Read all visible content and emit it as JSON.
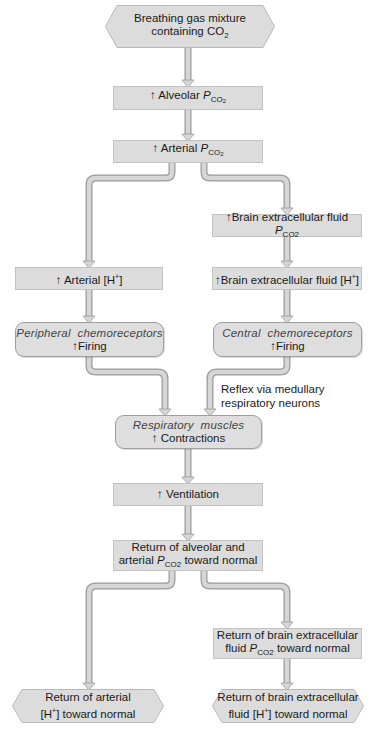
{
  "diagram": {
    "colors": {
      "box_fill": "#dcdcdc",
      "box_border": "#c2c2c2",
      "arrow_fill": "#d6d6d6",
      "arrow_stroke": "#9a9a9a"
    },
    "nodes": {
      "start": {
        "line1": "Breathing gas mixture",
        "line2_prefix": "containing CO",
        "line2_sub": "2"
      },
      "alveolar": {
        "arrow": "↑",
        "label": "Alveolar",
        "p": "P",
        "sub": "CO",
        "sub2": "2"
      },
      "arterial_pco2": {
        "arrow": "↑",
        "label": "Arterial",
        "p": "P",
        "sub": "CO",
        "sub2": "2"
      },
      "brain_pco2": {
        "arrow": "↑",
        "label": "Brain extracellular fluid",
        "p": "P",
        "sub": "CO2"
      },
      "arterial_h": {
        "arrow": "↑",
        "label": "Arterial [H",
        "sup": "+",
        "close": "]"
      },
      "brain_h": {
        "arrow": "↑",
        "label": "Brain extracellular fluid [H",
        "sup": "+",
        "close": "]"
      },
      "peripheral": {
        "title": "Peripheral  chemoreceptors",
        "arrow": "↑",
        "action": "Firing"
      },
      "central": {
        "title": "Central  chemoreceptors",
        "arrow": "↑",
        "action": "Firing"
      },
      "muscles": {
        "title": "Respiratory  muscles",
        "arrow": "↑",
        "action": "Contractions"
      },
      "ventilation": {
        "arrow": "↑",
        "label": "Ventilation"
      },
      "return_alveolar": {
        "line1": "Return of alveolar and",
        "line2_prefix": "arterial",
        "p": "P",
        "sub": "CO2",
        "line2_suffix": "toward normal"
      },
      "return_brain_pco2": {
        "line1": "Return of brain extracellular",
        "line2_prefix": "fluid",
        "p": "P",
        "sub": "CO2",
        "line2_suffix": "toward normal"
      },
      "return_arterial_h": {
        "line1": "Return of arterial",
        "line2_prefix": "[H",
        "sup": "+",
        "line2_suffix": "] toward normal"
      },
      "return_brain_h": {
        "line1": "Return of brain extracellular",
        "line2_prefix": "fluid [H",
        "sup": "+",
        "line2_suffix": "] toward normal"
      }
    },
    "annotations": {
      "reflex": {
        "line1": "Reflex via medullary",
        "line2": "respiratory neurons"
      }
    }
  }
}
